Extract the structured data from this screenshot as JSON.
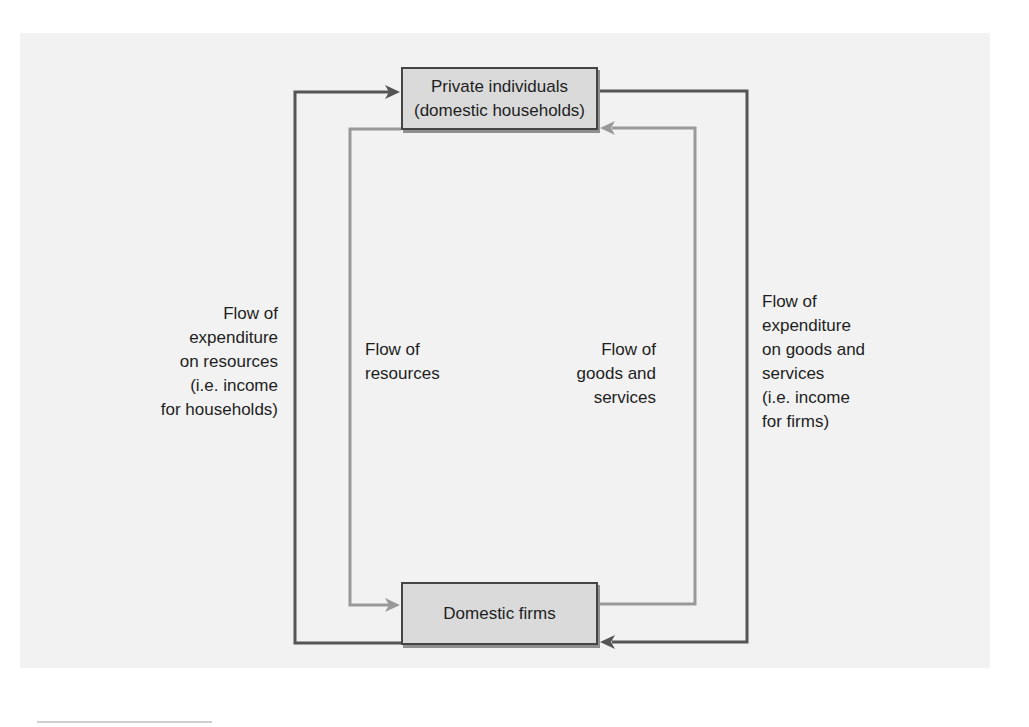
{
  "diagram": {
    "type": "circular-flow",
    "nodes": {
      "households": {
        "line1": "Private individuals",
        "line2": "(domestic households)"
      },
      "firms": {
        "label": "Domestic firms"
      }
    },
    "flows": {
      "expenditure_on_resources": {
        "lines": [
          "Flow of",
          "expenditure",
          "on resources",
          "(i.e. income",
          "for households)"
        ],
        "from": "firms",
        "to": "households",
        "color": "#555555"
      },
      "resources": {
        "lines": [
          "Flow of",
          "resources"
        ],
        "from": "households",
        "to": "firms",
        "color": "#999999"
      },
      "goods_and_services": {
        "lines": [
          "Flow of",
          "goods and",
          "services"
        ],
        "from": "firms",
        "to": "households",
        "color": "#999999"
      },
      "expenditure_on_goods": {
        "lines": [
          "Flow of",
          "expenditure",
          "on goods and",
          "services",
          "(i.e. income",
          "for firms)"
        ],
        "from": "households",
        "to": "firms",
        "color": "#555555"
      }
    },
    "colors": {
      "background": "#f2f2f2",
      "box_fill": "#dadada",
      "box_border": "#444444",
      "dark_flow": "#555555",
      "light_flow": "#999999"
    }
  }
}
